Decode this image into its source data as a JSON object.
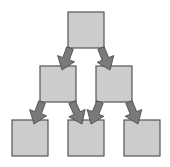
{
  "diagram": {
    "type": "tree-hierarchy",
    "colors": {
      "box_fill": "#cccccc",
      "box_stroke": "#555555",
      "arrow_fill": "#7a7a7a",
      "arrow_stroke": "#444444",
      "background": "#ffffff"
    },
    "nodes": [
      {
        "id": "root",
        "x": 68,
        "y": 12,
        "w": 36,
        "h": 36
      },
      {
        "id": "mid-left",
        "x": 40,
        "y": 66,
        "w": 36,
        "h": 36
      },
      {
        "id": "mid-right",
        "x": 96,
        "y": 66,
        "w": 36,
        "h": 36
      },
      {
        "id": "leaf-1",
        "x": 12,
        "y": 120,
        "w": 36,
        "h": 36
      },
      {
        "id": "leaf-2",
        "x": 68,
        "y": 120,
        "w": 36,
        "h": 36
      },
      {
        "id": "leaf-3",
        "x": 124,
        "y": 120,
        "w": 36,
        "h": 36
      }
    ],
    "edges": [
      {
        "from": "root",
        "to": "mid-left",
        "x1": 70,
        "y1": 48,
        "x2": 62,
        "y2": 70
      },
      {
        "from": "root",
        "to": "mid-right",
        "x1": 101,
        "y1": 48,
        "x2": 110,
        "y2": 70
      },
      {
        "from": "mid-left",
        "to": "leaf-1",
        "x1": 42,
        "y1": 102,
        "x2": 34,
        "y2": 124
      },
      {
        "from": "mid-left",
        "to": "leaf-2",
        "x1": 72,
        "y1": 102,
        "x2": 82,
        "y2": 124
      },
      {
        "from": "mid-right",
        "to": "leaf-2",
        "x1": 100,
        "y1": 102,
        "x2": 91,
        "y2": 124
      },
      {
        "from": "mid-right",
        "to": "leaf-3",
        "x1": 129,
        "y1": 102,
        "x2": 138,
        "y2": 124
      }
    ]
  }
}
